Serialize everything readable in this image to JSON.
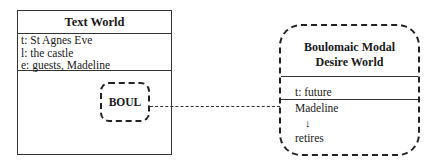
{
  "text_world": {
    "title": "Text World",
    "time": "t: St Agnes Eve",
    "location": "l: the castle",
    "entities": "e: guests, Madeline",
    "sub_world_label": "BOUL"
  },
  "desire_world": {
    "title_line1": "Boulomaic Modal",
    "title_line2": "Desire World",
    "time": "t: future",
    "entity": "Madeline",
    "arrow": "↓",
    "action": "retires"
  }
}
